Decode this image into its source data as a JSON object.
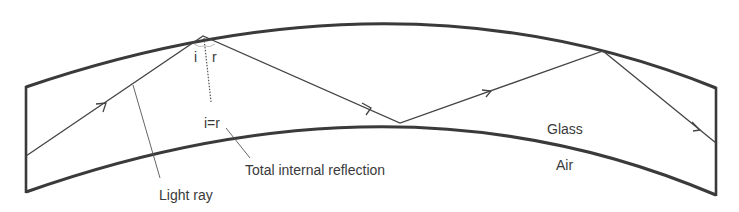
{
  "labels": {
    "angle_incidence": "i",
    "angle_reflection": "r",
    "equality": "i=r",
    "total_internal_reflection": "Total internal reflection",
    "light_ray": "Light ray",
    "glass": "Glass",
    "air": "Air"
  },
  "colors": {
    "outline": "#3a3a3a",
    "ray": "#444444",
    "text": "#3a3a3a",
    "background": "#ffffff"
  },
  "geometry": {
    "outer_curve": [
      [
        26,
        87
      ],
      [
        203,
        36
      ],
      [
        400,
        18
      ],
      [
        603,
        51
      ],
      [
        716,
        88
      ]
    ],
    "inner_curve": [
      [
        26,
        192
      ],
      [
        150,
        150
      ],
      [
        400,
        123
      ],
      [
        600,
        150
      ],
      [
        716,
        195
      ]
    ],
    "ray_path": [
      [
        26,
        156
      ],
      [
        203,
        36
      ],
      [
        400,
        123
      ],
      [
        603,
        51
      ],
      [
        716,
        143
      ]
    ]
  }
}
